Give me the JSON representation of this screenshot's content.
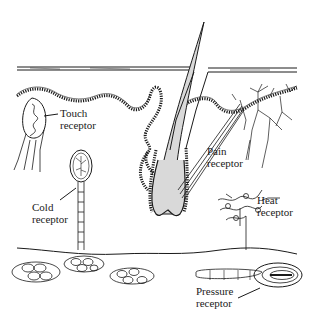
{
  "diagram": {
    "colors": {
      "line": "#1a1a1a",
      "hair_fill": "#d9d9d9",
      "background": "#ffffff"
    },
    "labels": {
      "touch": {
        "line1": "Touch",
        "line2": "receptor"
      },
      "pain": {
        "line1": "Pain",
        "line2": "receptor"
      },
      "cold": {
        "line1": "Cold",
        "line2": "receptor"
      },
      "heat": {
        "line1": "Heat",
        "line2": "receptor"
      },
      "pressure": {
        "line1": "Pressure",
        "line2": "receptor"
      }
    }
  }
}
